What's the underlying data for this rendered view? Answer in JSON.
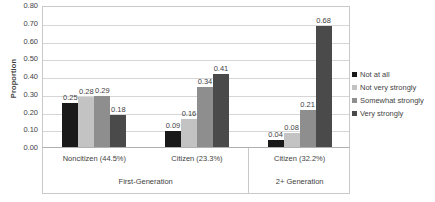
{
  "chart_data": {
    "type": "bar",
    "title": "",
    "xlabel": "",
    "ylabel": "Proportion",
    "ylim": [
      0,
      0.8
    ],
    "ytick_step": 0.1,
    "ytick_labels": [
      "0.80",
      "0.70",
      "0.60",
      "0.50",
      "0.40",
      "0.30",
      "0.20",
      "0.10",
      "0.00"
    ],
    "ytick_values": [
      0.8,
      0.7,
      0.6,
      0.5,
      0.4,
      0.3,
      0.2,
      0.1,
      0.0
    ],
    "grid": true,
    "legend_position": "right",
    "categories": [
      "Noncitizen (44.5%)",
      "Citizen (23.3%)",
      "Citizen (32.2%)"
    ],
    "group_labels": [
      "First-Generation",
      "2+ Generation"
    ],
    "group_spans": [
      2,
      1
    ],
    "series": [
      {
        "name": "Not at all",
        "color": "#191919",
        "values": [
          0.25,
          0.09,
          0.04
        ],
        "labels": [
          "0.25",
          "0.09",
          "0.04"
        ]
      },
      {
        "name": "Not very strongly",
        "color": "#c3c3c3",
        "values": [
          0.28,
          0.16,
          0.08
        ],
        "labels": [
          "0.28",
          "0.16",
          "0.08"
        ]
      },
      {
        "name": "Somewhat strongly",
        "color": "#8e8e8e",
        "values": [
          0.29,
          0.34,
          0.21
        ],
        "labels": [
          "0.29",
          "0.34",
          "0.21"
        ]
      },
      {
        "name": "Very strongly",
        "color": "#4a4a4a",
        "values": [
          0.18,
          0.41,
          0.68
        ],
        "labels": [
          "0.18",
          "0.41",
          "0.68"
        ]
      }
    ]
  }
}
